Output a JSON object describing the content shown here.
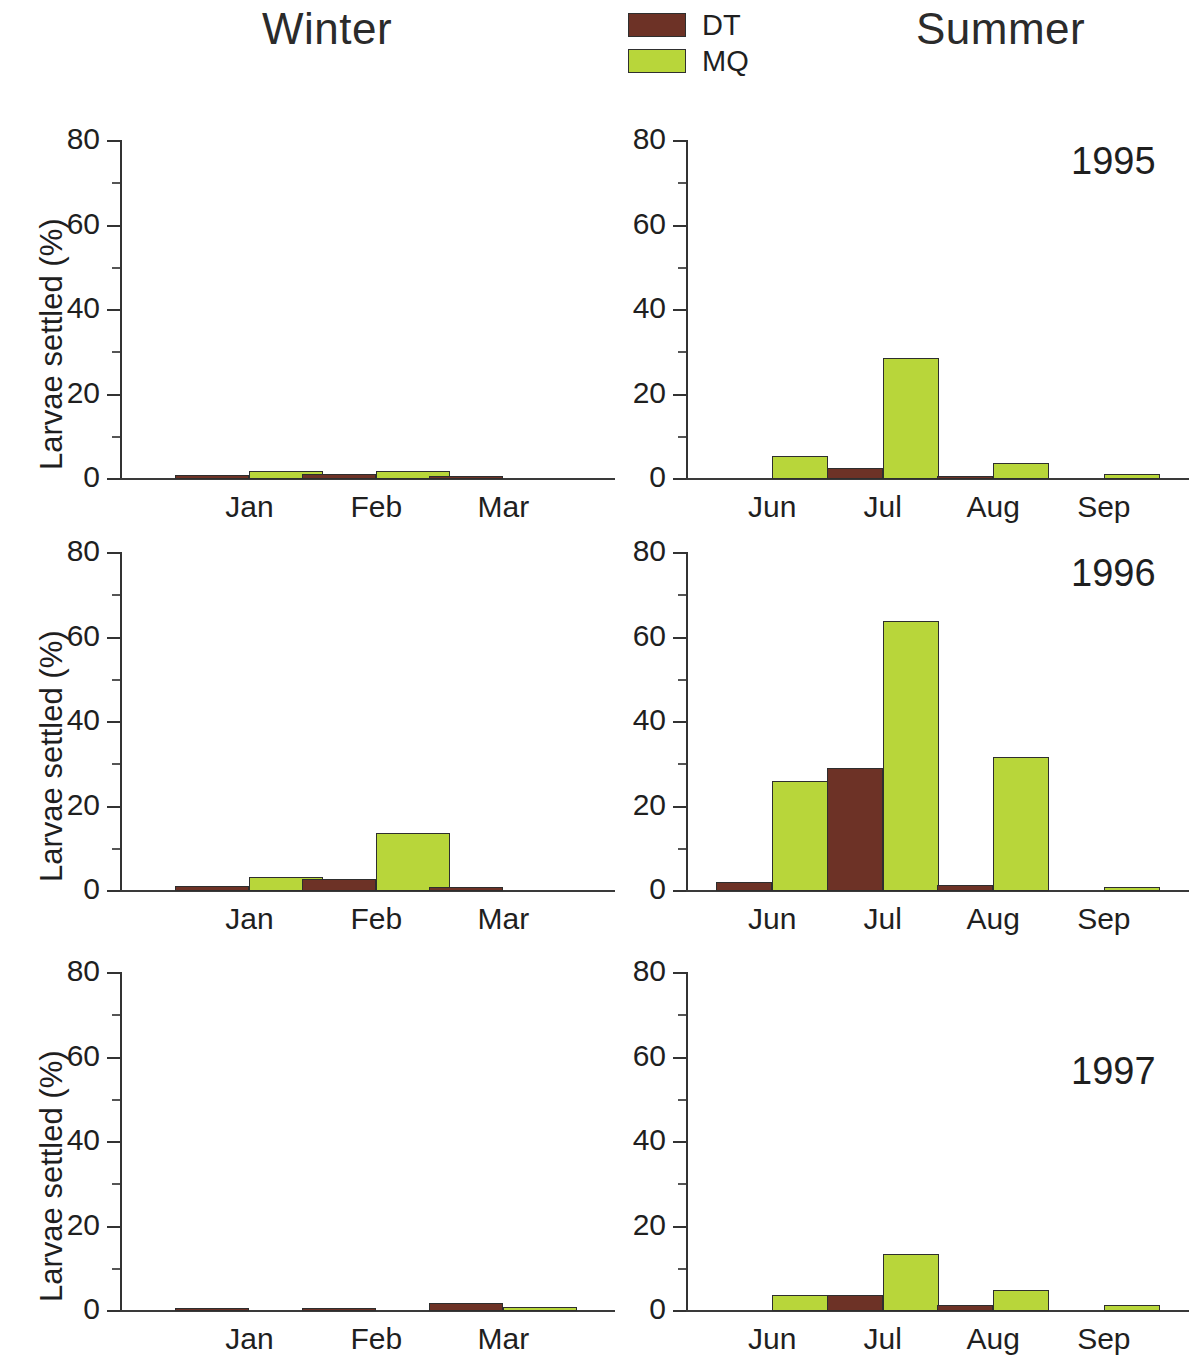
{
  "header": {
    "winter_title": "Winter",
    "summer_title": "Summer"
  },
  "legend": {
    "position": "top-center",
    "entries": [
      {
        "label": "DT",
        "color": "#6d3226"
      },
      {
        "label": "MQ",
        "color": "#b8d63a"
      }
    ]
  },
  "axes": {
    "ylabel": "Larvae settled (%)",
    "yticks": [
      "0",
      "20",
      "40",
      "60",
      "80"
    ],
    "ytick_values": [
      0,
      20,
      40,
      60,
      80
    ],
    "ylim": [
      0,
      80
    ],
    "winter_xticks": [
      "Jan",
      "Feb",
      "Mar"
    ],
    "summer_xticks": [
      "Jun",
      "Jul",
      "Aug",
      "Sep"
    ]
  },
  "year_labels": [
    "1995",
    "1996",
    "1997"
  ],
  "chart_data": {
    "type": "bar",
    "xlabel": "",
    "ylabel": "Larvae settled (%)",
    "ylim": [
      0,
      80
    ],
    "grid": false,
    "legend_position": "top-center",
    "series_names": [
      "DT",
      "MQ"
    ],
    "series_colors": {
      "DT": "#6d3226",
      "MQ": "#b8d63a"
    },
    "panels": [
      {
        "season": "Winter",
        "year": "1995",
        "categories": [
          "Jan",
          "Feb",
          "Mar"
        ],
        "series": [
          {
            "name": "DT",
            "values": [
              1.0,
              1.2,
              0.8
            ]
          },
          {
            "name": "MQ",
            "values": [
              1.8,
              2.0,
              0.0
            ]
          }
        ]
      },
      {
        "season": "Summer",
        "year": "1995",
        "categories": [
          "Jun",
          "Jul",
          "Aug",
          "Sep"
        ],
        "series": [
          {
            "name": "DT",
            "values": [
              0.0,
              2.6,
              0.5,
              0.0
            ]
          },
          {
            "name": "MQ",
            "values": [
              5.4,
              28.7,
              3.9,
              1.3
            ]
          }
        ]
      },
      {
        "season": "Winter",
        "year": "1996",
        "categories": [
          "Jan",
          "Feb",
          "Mar"
        ],
        "series": [
          {
            "name": "DT",
            "values": [
              1.2,
              2.9,
              1.0
            ]
          },
          {
            "name": "MQ",
            "values": [
              3.3,
              13.8,
              0.0
            ]
          }
        ]
      },
      {
        "season": "Summer",
        "year": "1996",
        "categories": [
          "Jun",
          "Jul",
          "Aug",
          "Sep"
        ],
        "series": [
          {
            "name": "DT",
            "values": [
              2.1,
              29.0,
              1.4,
              0.0
            ]
          },
          {
            "name": "MQ",
            "values": [
              26.0,
              63.8,
              31.8,
              0.9
            ]
          }
        ]
      },
      {
        "season": "Winter",
        "year": "1997",
        "categories": [
          "Jan",
          "Feb",
          "Mar"
        ],
        "series": [
          {
            "name": "DT",
            "values": [
              0.3,
              0.8,
              2.0
            ]
          },
          {
            "name": "MQ",
            "values": [
              0.0,
              0.0,
              1.0
            ]
          }
        ]
      },
      {
        "season": "Summer",
        "year": "1997",
        "categories": [
          "Jun",
          "Jul",
          "Aug",
          "Sep"
        ],
        "series": [
          {
            "name": "DT",
            "values": [
              0.0,
              3.8,
              1.5,
              0.0
            ]
          },
          {
            "name": "MQ",
            "values": [
              3.8,
              13.4,
              5.0,
              1.4
            ]
          }
        ]
      }
    ]
  }
}
